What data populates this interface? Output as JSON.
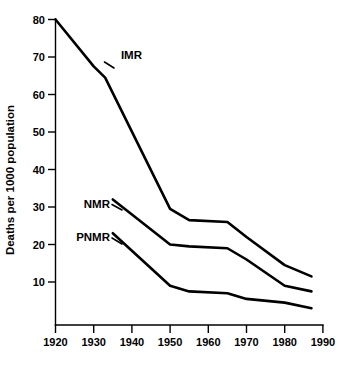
{
  "chart_data": {
    "type": "line",
    "title": "",
    "subtitle": "",
    "xlabel": "",
    "ylabel": "Deaths per 1000 population",
    "xlim": [
      1920,
      1990
    ],
    "ylim": [
      0,
      80
    ],
    "grid": false,
    "legend_position": "inline-annotations",
    "x_ticks": [
      1920,
      1930,
      1940,
      1950,
      1960,
      1970,
      1980,
      1990
    ],
    "x_tick_labels": [
      "1920",
      "1930",
      "1940",
      "1950",
      "1960",
      "1970",
      "1980",
      "1990"
    ],
    "y_ticks": [
      10,
      20,
      30,
      40,
      50,
      60,
      70,
      80
    ],
    "y_tick_labels": [
      "10",
      "20",
      "30",
      "40",
      "50",
      "60",
      "70",
      "80"
    ],
    "series": [
      {
        "name": "IMR",
        "label": "IMR",
        "color": "#000000",
        "x": [
          1920,
          1930,
          1933,
          1950,
          1955,
          1965,
          1970,
          1980,
          1987
        ],
        "values": [
          80,
          67.5,
          64.5,
          29.5,
          26.5,
          26,
          22,
          14.5,
          11.5
        ]
      },
      {
        "name": "NMR",
        "label": "NMR",
        "color": "#000000",
        "x": [
          1935,
          1950,
          1955,
          1965,
          1970,
          1980,
          1987
        ],
        "values": [
          32,
          20,
          19.5,
          19,
          16,
          9,
          7.5
        ]
      },
      {
        "name": "PNMR",
        "label": "PNMR",
        "color": "#000000",
        "x": [
          1935,
          1950,
          1955,
          1965,
          1970,
          1980,
          1987
        ],
        "values": [
          23,
          9,
          7.5,
          7,
          5.5,
          4.5,
          3
        ]
      }
    ],
    "annotations": [
      {
        "text": "IMR",
        "x": 1932,
        "y": 69
      },
      {
        "text": "NMR",
        "x": 1932,
        "y": 32.5
      },
      {
        "text": "PNMR",
        "x": 1932,
        "y": 23.5
      }
    ]
  },
  "axis": {
    "y_title": "Deaths per 1000 population"
  },
  "labels": {
    "imr": "IMR",
    "nmr": "NMR",
    "pnmr": "PNMR"
  },
  "x_tick_labels": {
    "t0": "1920",
    "t1": "1930",
    "t2": "1940",
    "t3": "1950",
    "t4": "1960",
    "t5": "1970",
    "t6": "1980",
    "t7": "1990"
  },
  "y_tick_labels": {
    "t80": "80",
    "t70": "70",
    "t60": "60",
    "t50": "50",
    "t40": "40",
    "t30": "30",
    "t20": "20",
    "t10": "10"
  }
}
